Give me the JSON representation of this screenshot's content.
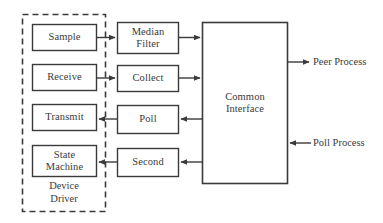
{
  "diagram": {
    "background_color": "#ffffff",
    "stroke_color": "#3a3a3a",
    "text_color": "#3a3a3a",
    "box_fill": "#ffffff",
    "group": {
      "caption": "Device\nDriver",
      "border_style": "dashed"
    },
    "driver_nodes": [
      {
        "id": "sample",
        "label": "Sample"
      },
      {
        "id": "receive",
        "label": "Receive"
      },
      {
        "id": "transmit",
        "label": "Transmit"
      },
      {
        "id": "state-machine",
        "label": "State\nMachine"
      }
    ],
    "middle_nodes": [
      {
        "id": "median-filter",
        "label": "Median\nFilter"
      },
      {
        "id": "collect",
        "label": "Collect"
      },
      {
        "id": "poll",
        "label": "Poll"
      },
      {
        "id": "second",
        "label": "Second"
      }
    ],
    "interface_node": {
      "id": "common-interface",
      "label": "Common\nInterface"
    },
    "external_labels": [
      {
        "id": "peer-process",
        "label": "Peer Process",
        "direction": "out"
      },
      {
        "id": "poll-process",
        "label": "Poll Process",
        "direction": "in"
      }
    ]
  }
}
